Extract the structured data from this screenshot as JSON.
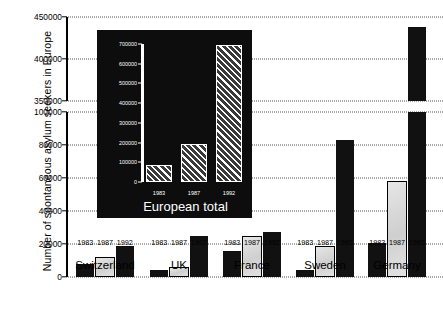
{
  "chart_data": {
    "type": "bar",
    "title": "",
    "xlabel": "",
    "ylabel": "Number of spontaneous asylum seekers in Europe",
    "categories": [
      "Switzerland",
      "UK",
      "France",
      "Sweden",
      "Germany"
    ],
    "years": [
      "1983",
      "1987",
      "1992"
    ],
    "series": [
      {
        "name": "1983",
        "values": [
          8000,
          4500,
          16000,
          4000,
          20500
        ]
      },
      {
        "name": "1987",
        "values": [
          12000,
          6000,
          25000,
          19000,
          58000
        ]
      },
      {
        "name": "1992",
        "values": [
          18500,
          25000,
          27500,
          83000,
          438000
        ]
      }
    ],
    "ylim": [
      0,
      450000
    ],
    "axis_break": {
      "lower_max": 100000,
      "upper_min": 350000
    },
    "yticks_lower": [
      "0",
      "20000",
      "40000",
      "60000",
      "80000",
      "100000"
    ],
    "yticks_upper": [
      "350000",
      "400000",
      "450000"
    ],
    "grid": "dotted-horizontal",
    "legend": "none"
  },
  "axis": {
    "y_title": "Number of spontaneous asylum seekers in Europe",
    "ticks": [
      {
        "label": "450000",
        "value": 450000
      },
      {
        "label": "400000",
        "value": 400000
      },
      {
        "label": "350000",
        "value": 350000
      },
      {
        "label": "100000",
        "value": 100000
      },
      {
        "label": "80000",
        "value": 80000
      },
      {
        "label": "60000",
        "value": 60000
      },
      {
        "label": "40000",
        "value": 40000
      },
      {
        "label": "20000",
        "value": 20000
      },
      {
        "label": "0",
        "value": 0
      }
    ]
  },
  "groups": [
    {
      "country": "Switzerland",
      "bars": [
        {
          "year": "1983",
          "value": 8000,
          "style": "solid"
        },
        {
          "year": "1987",
          "value": 12000,
          "style": "light"
        },
        {
          "year": "1992",
          "value": 18500,
          "style": "solid"
        }
      ]
    },
    {
      "country": "UK",
      "bars": [
        {
          "year": "1983",
          "value": 4500,
          "style": "solid"
        },
        {
          "year": "1987",
          "value": 6000,
          "style": "light"
        },
        {
          "year": "1992",
          "value": 25000,
          "style": "solid"
        }
      ]
    },
    {
      "country": "France",
      "bars": [
        {
          "year": "1983",
          "value": 16000,
          "style": "solid"
        },
        {
          "year": "1987",
          "value": 25000,
          "style": "light"
        },
        {
          "year": "1992",
          "value": 27500,
          "style": "solid"
        }
      ]
    },
    {
      "country": "Sweden",
      "bars": [
        {
          "year": "1983",
          "value": 4000,
          "style": "solid"
        },
        {
          "year": "1987",
          "value": 19000,
          "style": "light"
        },
        {
          "year": "1992",
          "value": 83000,
          "style": "solid"
        }
      ]
    },
    {
      "country": "Germany",
      "bars": [
        {
          "year": "1983",
          "value": 20500,
          "style": "solid"
        },
        {
          "year": "1987",
          "value": 58000,
          "style": "light"
        },
        {
          "year": "1992",
          "value": 438000,
          "style": "broken"
        }
      ]
    }
  ],
  "inset": {
    "caption": "European total",
    "background_color": "#0d0d0d",
    "text_color": "#ffffff",
    "chart_data": {
      "type": "bar",
      "categories": [
        "1983",
        "1987",
        "1992"
      ],
      "values": [
        85000,
        195000,
        695000
      ],
      "title": "European total",
      "xlabel": "",
      "ylabel": "",
      "ylim": [
        0,
        700000
      ],
      "yticks": [
        "0",
        "100000",
        "200000",
        "300000",
        "400000",
        "500000",
        "600000",
        "700000"
      ],
      "bar_fill": "diagonal-hatch"
    },
    "ticks": [
      {
        "label": "700000",
        "value": 700000
      },
      {
        "label": "600000",
        "value": 600000
      },
      {
        "label": "500000",
        "value": 500000
      },
      {
        "label": "400000",
        "value": 400000
      },
      {
        "label": "300000",
        "value": 300000
      },
      {
        "label": "200000",
        "value": 200000
      },
      {
        "label": "100000",
        "value": 100000
      },
      {
        "label": "0",
        "value": 0
      }
    ],
    "years": [
      "1983",
      "1987",
      "1992"
    ]
  }
}
